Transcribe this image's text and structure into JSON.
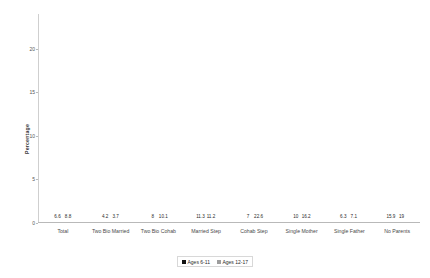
{
  "chart_data": {
    "type": "bar",
    "title": "",
    "xlabel": "",
    "ylabel": "Percentage",
    "ylim": [
      0,
      24
    ],
    "yticks": [
      "0",
      "5",
      "10",
      "15",
      "20"
    ],
    "grid": false,
    "legend_position": "bottom-center",
    "categories": [
      "Total",
      "Two Bio Married",
      "Two Bio Cohab",
      "Married Step",
      "Cohab Step",
      "Single Mother",
      "Single Father",
      "No Parents"
    ],
    "series": [
      {
        "name": "Ages 6-11",
        "color": "#121212",
        "values": [
          6.6,
          4.2,
          8,
          11.3,
          7,
          10,
          6.3,
          15.9
        ],
        "labels": [
          "6.6",
          "4.2",
          "8",
          "11.3",
          "7",
          "10",
          "6.3",
          "15.9"
        ]
      },
      {
        "name": "Ages 12-17",
        "color": "#9d9d9d",
        "values": [
          8.8,
          3.7,
          10.1,
          11.2,
          22.6,
          16.2,
          7.1,
          19
        ],
        "labels": [
          "8.8",
          "3.7",
          "10.1",
          "11.2",
          "22.6",
          "16.2",
          "7.1",
          "19"
        ]
      }
    ]
  }
}
